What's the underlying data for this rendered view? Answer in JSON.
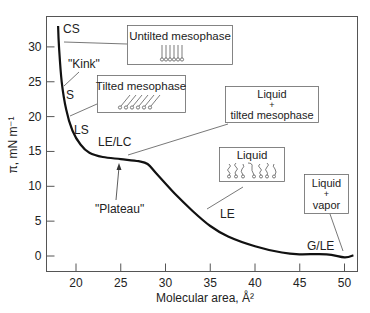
{
  "chart_data": {
    "type": "line",
    "title": "",
    "xlabel": "Molecular area, Å²",
    "ylabel": "π, mN m⁻¹",
    "xlim": [
      17,
      51.5
    ],
    "ylim": [
      -2,
      34
    ],
    "grid": false,
    "x_ticks": [
      20,
      25,
      30,
      35,
      40,
      45,
      50
    ],
    "y_ticks": [
      0,
      5,
      10,
      15,
      20,
      25,
      30
    ],
    "series": [
      {
        "name": "Surface pressure isotherm",
        "x": [
          18.0,
          18.1,
          18.4,
          18.9,
          19.6,
          20.5,
          21.5,
          23,
          25,
          27,
          28,
          29,
          31,
          33,
          35,
          37,
          40,
          43,
          45,
          48,
          50,
          51
        ],
        "y": [
          33,
          30,
          25,
          21,
          18,
          16,
          14.8,
          14.2,
          13.9,
          13.6,
          13.2,
          11.8,
          9,
          6.5,
          4.3,
          2.8,
          1.4,
          0.5,
          0.25,
          0.25,
          -0.2,
          0.1
        ]
      }
    ],
    "annotations": {
      "phase_labels": [
        "CS",
        "S",
        "LS",
        "LE/LC",
        "LE",
        "G/LE"
      ],
      "notes": [
        "\"Kink\"",
        "\"Plateau\""
      ],
      "boxes": [
        {
          "title": "Untilted mesophase",
          "line2": ""
        },
        {
          "title": "Tilted mesophase",
          "line2": ""
        },
        {
          "title": "Liquid",
          "line2": "+",
          "line3": "tilted mesophase"
        },
        {
          "title": "Liquid",
          "line2": ""
        },
        {
          "title": "Liquid",
          "line2": "+",
          "line3": "vapor"
        }
      ]
    }
  }
}
